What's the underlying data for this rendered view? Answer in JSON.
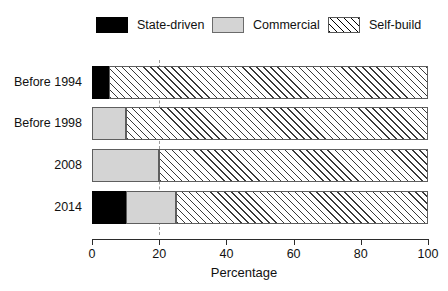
{
  "chart_data": {
    "type": "bar",
    "orientation": "horizontal",
    "stacked": true,
    "title": "",
    "xlabel": "Percentage",
    "ylabel": "",
    "xlim": [
      0,
      100
    ],
    "xticks": [
      0,
      20,
      40,
      60,
      80,
      100
    ],
    "grid": "vertical dashed gridline at 20",
    "gridlines": [
      20
    ],
    "legend_position": "top",
    "categories": [
      "Before 1994",
      "Before 1998",
      "2008",
      "2014"
    ],
    "series": [
      {
        "name": "State-driven",
        "values": [
          5,
          0,
          0,
          10
        ],
        "color": "#000000",
        "pattern": "solid"
      },
      {
        "name": "Commercial",
        "values": [
          0,
          10,
          20,
          15
        ],
        "color": "#d4d4d4",
        "pattern": "solid"
      },
      {
        "name": "Self-build",
        "values": [
          95,
          90,
          80,
          75
        ],
        "color": "#ffffff",
        "pattern": "diagonal-hatch"
      }
    ]
  },
  "legend": {
    "items": [
      {
        "label": "State-driven",
        "swatch": "black-swatch"
      },
      {
        "label": "Commercial",
        "swatch": "gray-swatch"
      },
      {
        "label": "Self-build",
        "swatch": "hatched-swatch"
      }
    ]
  },
  "axes": {
    "x": {
      "title": "Percentage",
      "tick_labels": [
        "0",
        "20",
        "40",
        "60",
        "80",
        "100"
      ]
    },
    "y": {
      "tick_labels": [
        "Before 1994",
        "Before 1998",
        "2008",
        "2014"
      ]
    }
  }
}
